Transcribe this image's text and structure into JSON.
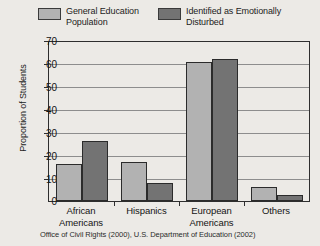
{
  "chart_data": {
    "type": "bar",
    "title": "",
    "xlabel": "",
    "ylabel": "Proportion of Students",
    "ylim": [
      0,
      70
    ],
    "yticks": [
      0,
      10,
      20,
      30,
      40,
      50,
      60,
      70
    ],
    "grid": true,
    "legend_position": "top",
    "categories": [
      "African\nAmericans",
      "Hispanics",
      "European\nAmericans",
      "Others"
    ],
    "series": [
      {
        "name": "General Education\nPopulation",
        "color": "#b2b2b2",
        "values": [
          16.5,
          17,
          61,
          6
        ]
      },
      {
        "name": "Identified as Emotionally\nDisturbed",
        "color": "#737373",
        "values": [
          26.5,
          8,
          62.5,
          2.5
        ]
      }
    ],
    "source_note": "Office of Civil Rights (2000), U.S. Department of Education (2002)"
  },
  "legend": {
    "entries": [
      {
        "label": "General Education\nPopulation",
        "swatch": "#b2b2b2"
      },
      {
        "label": "Identified as Emotionally\nDisturbed",
        "swatch": "#737373"
      }
    ]
  },
  "axis": {
    "y_title": "Proportion of Students",
    "y_tick_labels": [
      "70",
      "60",
      "50",
      "40",
      "30",
      "20",
      "10",
      "0"
    ],
    "x_tick_labels": [
      "African\nAmericans",
      "Hispanics",
      "European\nAmericans",
      "Others"
    ]
  },
  "footer": {
    "source": "Office of Civil Rights (2000), U.S. Department of Education (2002)"
  },
  "colors": {
    "background": "#eceae6",
    "series_light": "#b2b2b2",
    "series_dark": "#737373",
    "axis": "#2e2e2e",
    "gridline": "#8d8d8d",
    "text": "#141414"
  }
}
